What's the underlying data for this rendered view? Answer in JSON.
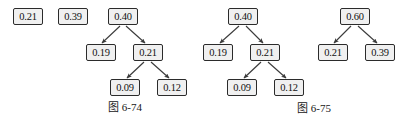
{
  "figure": {
    "background_color": "#ffffff",
    "node_fill": "#f0f0f0",
    "node_border": "#2b2b2b",
    "edge_color": "#3a3a3a",
    "figures": [
      {
        "id": "figure-6-74",
        "caption": "图 6-74",
        "caption_x": 108,
        "caption_y": 100,
        "standalone_nodes": [
          {
            "id": "n674-a",
            "label": "0.21",
            "x": 13,
            "y": 8
          },
          {
            "id": "n674-b",
            "label": "0.39",
            "x": 58,
            "y": 8
          }
        ],
        "tree_nodes": [
          {
            "id": "n674-root",
            "label": "0.40",
            "x": 108,
            "y": 8
          },
          {
            "id": "n674-l1a",
            "label": "0.19",
            "x": 86,
            "y": 44
          },
          {
            "id": "n674-l1b",
            "label": "0.21",
            "x": 133,
            "y": 44
          },
          {
            "id": "n674-l2a",
            "label": "0.09",
            "x": 110,
            "y": 79
          },
          {
            "id": "n674-l2b",
            "label": "0.12",
            "x": 157,
            "y": 79
          }
        ],
        "edges": [
          {
            "from": "n674-root",
            "to": "n674-l1a",
            "x1": 120,
            "y1": 26,
            "x2": 102,
            "y2": 43
          },
          {
            "from": "n674-root",
            "to": "n674-l1b",
            "x1": 126,
            "y1": 26,
            "x2": 145,
            "y2": 43
          },
          {
            "from": "n674-l1b",
            "to": "n674-l2a",
            "x1": 144,
            "y1": 62,
            "x2": 127,
            "y2": 78
          },
          {
            "from": "n674-l1b",
            "to": "n674-l2b",
            "x1": 151,
            "y1": 62,
            "x2": 169,
            "y2": 78
          }
        ]
      },
      {
        "id": "figure-6-75",
        "caption": "图 6-75",
        "caption_x": 297,
        "caption_y": 101,
        "standalone_nodes": [],
        "tree_nodes": [
          {
            "id": "n675-root",
            "label": "0.40",
            "x": 228,
            "y": 8
          },
          {
            "id": "n675-l1a",
            "label": "0.19",
            "x": 203,
            "y": 44
          },
          {
            "id": "n675-l1b",
            "label": "0.21",
            "x": 250,
            "y": 44
          },
          {
            "id": "n675-l2a",
            "label": "0.09",
            "x": 227,
            "y": 79
          },
          {
            "id": "n675-l2b",
            "label": "0.12",
            "x": 274,
            "y": 79
          },
          {
            "id": "n675-root2",
            "label": "0.60",
            "x": 340,
            "y": 8
          },
          {
            "id": "n675-r1a",
            "label": "0.21",
            "x": 318,
            "y": 44
          },
          {
            "id": "n675-r1b",
            "label": "0.39",
            "x": 365,
            "y": 44
          }
        ],
        "edges": [
          {
            "from": "n675-root",
            "to": "n675-l1a",
            "x1": 239,
            "y1": 26,
            "x2": 220,
            "y2": 43
          },
          {
            "from": "n675-root",
            "to": "n675-l1b",
            "x1": 246,
            "y1": 26,
            "x2": 263,
            "y2": 43
          },
          {
            "from": "n675-l1b",
            "to": "n675-l2a",
            "x1": 261,
            "y1": 62,
            "x2": 244,
            "y2": 78
          },
          {
            "from": "n675-l1b",
            "to": "n675-l2b",
            "x1": 268,
            "y1": 62,
            "x2": 286,
            "y2": 78
          },
          {
            "from": "n675-root2",
            "to": "n675-r1a",
            "x1": 351,
            "y1": 26,
            "x2": 334,
            "y2": 43
          },
          {
            "from": "n675-root2",
            "to": "n675-r1b",
            "x1": 358,
            "y1": 26,
            "x2": 377,
            "y2": 43
          }
        ]
      }
    ]
  }
}
